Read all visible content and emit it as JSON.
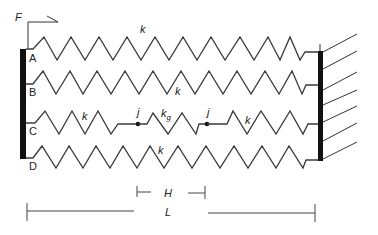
{
  "force": {
    "label": "F"
  },
  "nodes": {
    "A": "A",
    "B": "B",
    "C": "C",
    "D": "D"
  },
  "springs": {
    "A": {
      "stiffness_label": "k"
    },
    "B": {
      "stiffness_label": "k"
    },
    "C_left": {
      "stiffness_label": "k"
    },
    "C_middle": {
      "stiffness_label": "k",
      "subscript": "g"
    },
    "C_right": {
      "stiffness_label": "k"
    },
    "D": {
      "stiffness_label": "k"
    }
  },
  "joints": {
    "left": "j",
    "right": "j"
  },
  "dimensions": {
    "H": "H",
    "L": "L"
  },
  "colors": {
    "line": "#3a3a3a",
    "wall": "#111111",
    "background": "#ffffff"
  }
}
